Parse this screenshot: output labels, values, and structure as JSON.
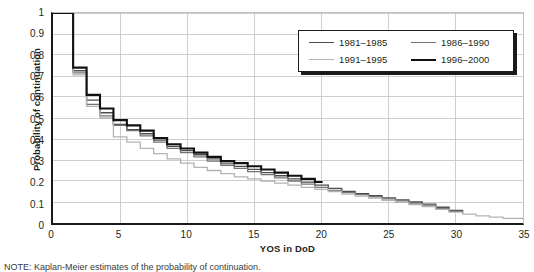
{
  "chart_data": {
    "type": "line",
    "title": "",
    "xlabel": "YOS in DoD",
    "ylabel": "Probability of continuation",
    "xlim": [
      0,
      35
    ],
    "ylim": [
      0,
      1
    ],
    "xticks": [
      "0",
      "5",
      "10",
      "15",
      "20",
      "25",
      "30",
      "35"
    ],
    "xtick_values": [
      0,
      5,
      10,
      15,
      20,
      25,
      30,
      35
    ],
    "yticks": [
      "0",
      "0.1",
      "0.2",
      "0.3",
      "0.4",
      "0.5",
      "0.6",
      "0.7",
      "0.8",
      "0.9",
      "1"
    ],
    "ytick_values": [
      0,
      0.1,
      0.2,
      0.3,
      0.4,
      0.5,
      0.6,
      0.7,
      0.8,
      0.9,
      1
    ],
    "grid": "both",
    "step_style": "post",
    "legend_position": "top-right",
    "note": "NOTE: Kaplan-Meier estimates of the probability of continuation.",
    "series": [
      {
        "name": "1981–1985",
        "color": "#4d4d4d",
        "width": 1.3,
        "x": [
          0,
          1.5,
          2.5,
          3.5,
          4.5,
          5.5,
          6.5,
          7.5,
          8.5,
          9.5,
          10.5,
          11.5,
          12.5,
          13.5,
          14.5,
          15.5,
          16.5,
          17.5,
          18.5,
          19.5,
          20.5,
          21.5,
          22.5,
          23.5,
          24.5,
          25.5,
          26.5,
          27.5,
          28.5,
          29.5,
          30.5
        ],
        "values": [
          1.0,
          0.725,
          0.585,
          0.525,
          0.47,
          0.445,
          0.425,
          0.395,
          0.365,
          0.345,
          0.325,
          0.305,
          0.285,
          0.27,
          0.255,
          0.24,
          0.225,
          0.21,
          0.195,
          0.18,
          0.165,
          0.15,
          0.14,
          0.13,
          0.12,
          0.11,
          0.1,
          0.09,
          0.075,
          0.06,
          0.05
        ]
      },
      {
        "name": "1986–1990",
        "color": "#737373",
        "width": 1.3,
        "x": [
          0,
          1.5,
          2.5,
          3.5,
          4.5,
          5.5,
          6.5,
          7.5,
          8.5,
          9.5,
          10.5,
          11.5,
          12.5,
          13.5,
          14.5,
          15.5,
          16.5,
          17.5,
          18.5,
          19.5,
          20.5,
          21.5,
          22.5,
          23.5,
          24.5,
          25.5,
          26.5,
          27.5,
          28.5,
          29.5,
          30.5
        ],
        "values": [
          1.0,
          0.715,
          0.565,
          0.51,
          0.465,
          0.44,
          0.415,
          0.385,
          0.355,
          0.335,
          0.315,
          0.295,
          0.275,
          0.26,
          0.245,
          0.23,
          0.215,
          0.2,
          0.185,
          0.17,
          0.155,
          0.145,
          0.135,
          0.125,
          0.115,
          0.105,
          0.095,
          0.085,
          0.07,
          0.055,
          0.045
        ]
      },
      {
        "name": "1991–1995",
        "color": "#b3b3b3",
        "width": 1.3,
        "x": [
          0,
          1.5,
          2.5,
          3.5,
          4.5,
          5.5,
          6.5,
          7.5,
          8.5,
          9.5,
          10.5,
          11.5,
          12.5,
          13.5,
          14.5,
          15.5,
          16.5,
          17.5,
          18.5,
          19.5,
          20.5,
          21.5,
          22.5,
          23.5,
          24.5,
          25.5,
          26.5,
          27.5,
          28.5,
          29.5,
          30.5,
          31.5,
          32.5,
          33.5,
          35
        ],
        "values": [
          1.0,
          0.705,
          0.555,
          0.5,
          0.41,
          0.385,
          0.355,
          0.33,
          0.305,
          0.285,
          0.265,
          0.25,
          0.235,
          0.22,
          0.21,
          0.2,
          0.19,
          0.18,
          0.17,
          0.16,
          0.15,
          0.138,
          0.128,
          0.118,
          0.108,
          0.098,
          0.088,
          0.078,
          0.065,
          0.052,
          0.042,
          0.034,
          0.028,
          0.022,
          0.015
        ]
      },
      {
        "name": "1996–2000",
        "color": "#111111",
        "width": 2.1,
        "x": [
          0,
          1.5,
          2.5,
          3.5,
          4.5,
          5.5,
          6.5,
          7.5,
          8.5,
          9.5,
          10.5,
          11.5,
          12.5,
          13.5,
          14.5,
          15.5,
          16.5,
          17.5,
          18.5,
          19.5,
          20
        ],
        "values": [
          1.0,
          0.74,
          0.61,
          0.545,
          0.49,
          0.465,
          0.44,
          0.405,
          0.375,
          0.355,
          0.335,
          0.315,
          0.295,
          0.285,
          0.27,
          0.255,
          0.24,
          0.225,
          0.21,
          0.195,
          0.19
        ]
      }
    ]
  },
  "legend": {
    "entries": [
      {
        "label": "1981–1985",
        "color": "#4d4d4d",
        "thickness": "1.6px"
      },
      {
        "label": "1986–1990",
        "color": "#737373",
        "thickness": "1.4px"
      },
      {
        "label": "1991–1995",
        "color": "#b3b3b3",
        "thickness": "1.3px"
      },
      {
        "label": "1996–2000",
        "color": "#111111",
        "thickness": "2.4px"
      }
    ]
  },
  "axes": {
    "x_title": "YOS in DoD",
    "y_title": "Probability of continuation"
  },
  "footnote": {
    "text": "NOTE: Kaplan-Meier estimates of the probability of continuation."
  },
  "colors": {
    "grid": "#c8c8c8",
    "axis": "#1a1a1a",
    "text": "#231f20"
  }
}
